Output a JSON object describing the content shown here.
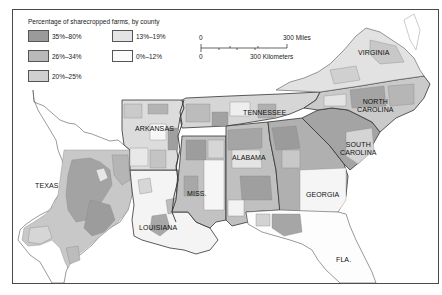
{
  "legend": {
    "title": "Percentage of sharecropped farms, by county",
    "items": [
      {
        "label": "35%–80%",
        "color": "#9a9a9a"
      },
      {
        "label": "26%–34%",
        "color": "#b9b9b9"
      },
      {
        "label": "20%–25%",
        "color": "#d0d0d0"
      },
      {
        "label": "13%–19%",
        "color": "#e4e4e4"
      },
      {
        "label": "0%–12%",
        "color": "#fbfbfb"
      }
    ]
  },
  "scale_bar": {
    "top_zero": "0",
    "top_label": "300 Miles",
    "bottom_zero": "0",
    "bottom_label": "300 Kilometers"
  },
  "states": {
    "virginia": "VIRGINIA",
    "north_carolina_1": "NORTH",
    "north_carolina_2": "CAROLINA",
    "tennessee": "TENNESSEE",
    "arkansas": "ARKANSAS",
    "south_carolina_1": "SOUTH",
    "south_carolina_2": "CAROLINA",
    "alabama": "ALABAMA",
    "texas": "TEXAS",
    "mississippi": "MISS.",
    "georgia": "GEORGIA",
    "louisiana": "LOUISIANA",
    "florida": "FLA."
  },
  "colors": {
    "border": "#4a4a4a",
    "state_line": "#333333",
    "county_line": "#8a8a8a",
    "water": "#ffffff"
  }
}
